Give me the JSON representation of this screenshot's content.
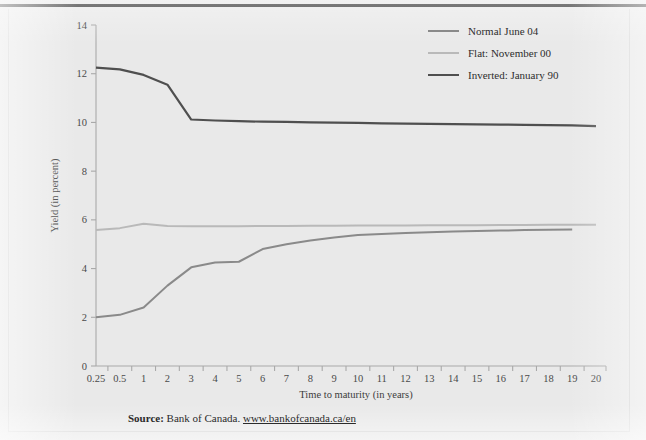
{
  "figure": {
    "background_color": "#e9e9e9",
    "rule_color": "#3a3a3a"
  },
  "legend": {
    "position": "top-right",
    "items": [
      {
        "label": "Normal June 04",
        "color": "#8a8a8a",
        "width": 2.0
      },
      {
        "label": "Flat: November 00",
        "color": "#b9b9b9",
        "width": 2.0
      },
      {
        "label": "Inverted: January 90",
        "color": "#4f4f4f",
        "width": 2.2
      }
    ]
  },
  "source": {
    "label": "Source:",
    "organization": "Bank of Canada.",
    "url": "www.bankofcanada.ca/en"
  },
  "chart_data": {
    "type": "line",
    "title": "",
    "xlabel": "Time to maturity (in years)",
    "ylabel": "Yield (in percent)",
    "categories": [
      "0.25",
      "0.5",
      "1",
      "2",
      "3",
      "4",
      "5",
      "6",
      "7",
      "8",
      "9",
      "10",
      "11",
      "12",
      "13",
      "14",
      "15",
      "16",
      "17",
      "18",
      "19",
      "20"
    ],
    "ylim": [
      0,
      14
    ],
    "yticks": [
      0,
      2,
      4,
      6,
      8,
      10,
      12,
      14
    ],
    "grid": false,
    "legend_position": "top-right",
    "series": [
      {
        "name": "Normal June 04",
        "color": "#8a8a8a",
        "values": [
          2.0,
          2.1,
          2.4,
          3.3,
          4.05,
          4.25,
          4.28,
          4.8,
          5.0,
          5.15,
          5.28,
          5.38,
          5.42,
          5.46,
          5.49,
          5.52,
          5.54,
          5.56,
          5.58,
          5.59,
          5.6,
          null
        ]
      },
      {
        "name": "Flat: November 00",
        "color": "#b9b9b9",
        "values": [
          5.58,
          5.66,
          5.84,
          5.75,
          5.74,
          5.74,
          5.74,
          5.75,
          5.75,
          5.76,
          5.76,
          5.77,
          5.77,
          5.77,
          5.78,
          5.78,
          5.78,
          5.79,
          5.79,
          5.8,
          5.8,
          5.8
        ]
      },
      {
        "name": "Inverted: January 90",
        "color": "#4f4f4f",
        "values": [
          12.25,
          12.18,
          11.95,
          11.55,
          10.12,
          10.08,
          10.05,
          10.03,
          10.02,
          10.0,
          9.99,
          9.98,
          9.96,
          9.95,
          9.94,
          9.93,
          9.92,
          9.91,
          9.9,
          9.89,
          9.88,
          9.85
        ]
      }
    ]
  }
}
